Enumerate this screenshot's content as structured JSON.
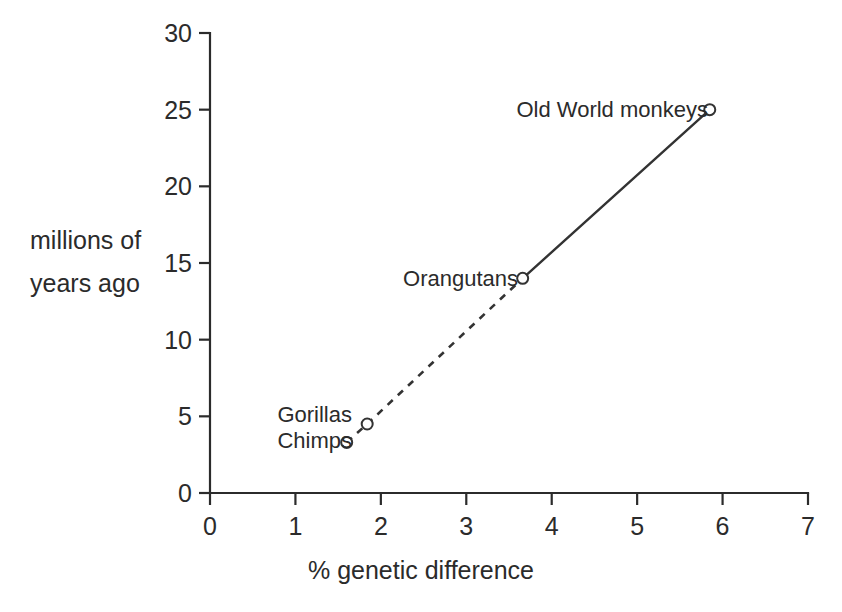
{
  "chart_data": {
    "type": "line",
    "title": "",
    "xlabel": "% genetic difference",
    "ylabel": "millions of years ago",
    "ylabel_lines": [
      "millions of",
      "years ago"
    ],
    "xlim": [
      0,
      7
    ],
    "ylim": [
      0,
      30
    ],
    "xticks": [
      0,
      1,
      2,
      3,
      4,
      5,
      6,
      7
    ],
    "yticks": [
      0,
      5,
      10,
      15,
      20,
      25,
      30
    ],
    "xtick_labels": [
      "0",
      "1",
      "2",
      "3",
      "4",
      "5",
      "6",
      "7"
    ],
    "ytick_labels": [
      "0",
      "5",
      "10",
      "15",
      "20",
      "25",
      "30"
    ],
    "grid": false,
    "legend": false,
    "marker": "open-circle",
    "line_color": "#333333",
    "axis_color": "#2b2b2b",
    "points": [
      {
        "label": "Chimps",
        "x": 1.6,
        "y": 3.3
      },
      {
        "label": "Gorillas",
        "x": 1.84,
        "y": 4.5
      },
      {
        "label": "Orangutans",
        "x": 3.66,
        "y": 14.0
      },
      {
        "label": "Old World monkeys",
        "x": 5.85,
        "y": 25.0
      }
    ],
    "segments": [
      {
        "from": "Chimps",
        "to": "Gorillas",
        "style": "dashed"
      },
      {
        "from": "Gorillas",
        "to": "Orangutans",
        "style": "dashed"
      },
      {
        "from": "Orangutans",
        "to": "Old World monkeys",
        "style": "solid"
      }
    ],
    "annotations": [
      {
        "text": "Gorillas",
        "for": "Gorillas"
      },
      {
        "text": "Chimps",
        "for": "Chimps"
      },
      {
        "text": "Orangutans",
        "for": "Orangutans"
      },
      {
        "text": "Old World monkeys",
        "for": "Old World monkeys"
      }
    ]
  }
}
